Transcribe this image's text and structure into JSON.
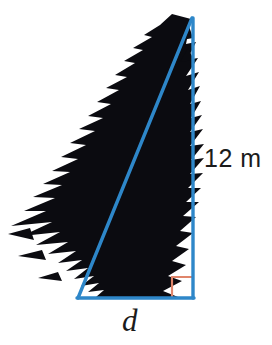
{
  "figure": {
    "type": "geometry-diagram",
    "background_color": "#ffffff"
  },
  "colors": {
    "line_blue": "#2e87c9",
    "right_angle_marker": "#e0856b",
    "tree_silhouette": "#0b0b10",
    "text": "#1b1b1b"
  },
  "labels": {
    "height": "12 m",
    "base": "d"
  },
  "geometry": {
    "apex": {
      "x": 192,
      "y": 18
    },
    "bottom_left": {
      "x": 78,
      "y": 298
    },
    "bottom_right": {
      "x": 193,
      "y": 298
    },
    "vertical_side_label": "12 m",
    "horizontal_side_label": "d",
    "hypotenuse_label": "",
    "right_angle_at": "bottom-right",
    "line_width_px": 3
  },
  "icons": {
    "tree": "fir-tree-silhouette-icon",
    "right_angle": "right-angle-marker-icon"
  }
}
